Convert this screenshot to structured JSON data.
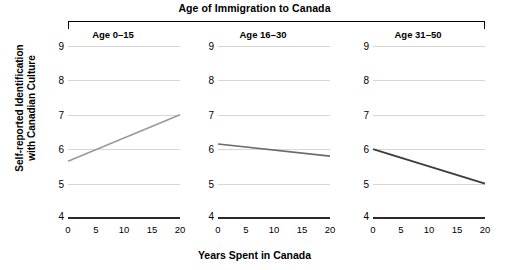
{
  "chart_data": {
    "type": "line",
    "title": "Age of Immigration to Canada",
    "xlabel": "Years Spent in Canada",
    "ylabel_line1": "Self-reported Identification",
    "ylabel_line2": "with Canadian Culture",
    "ylim": [
      4,
      9
    ],
    "xlim": [
      0,
      20
    ],
    "yticks": [
      9,
      8,
      7,
      6,
      5,
      4
    ],
    "xticks": [
      0,
      5,
      10,
      15,
      20
    ],
    "grid": true,
    "legend": "none",
    "layout": "faceted-3-panels",
    "panels": [
      {
        "label": "Age 0–15",
        "color": "#9a9a9a",
        "x": [
          0,
          20
        ],
        "values": [
          5.65,
          7.0
        ]
      },
      {
        "label": "Age 16–30",
        "color": "#6b6b6b",
        "x": [
          0,
          20
        ],
        "values": [
          6.15,
          5.8
        ]
      },
      {
        "label": "Age 31–50",
        "color": "#3c3c3c",
        "x": [
          0,
          20
        ],
        "values": [
          6.0,
          5.0
        ]
      }
    ]
  }
}
